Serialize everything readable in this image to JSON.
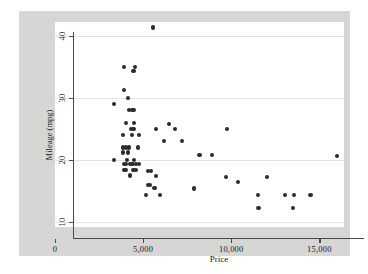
{
  "chart_data": {
    "type": "scatter",
    "title": "",
    "xlabel": "Price",
    "ylabel": "Mileage (mpg)",
    "xlim": [
      0,
      16400
    ],
    "ylim": [
      9.2,
      42.2
    ],
    "grid": true,
    "legend": null,
    "xticks": [
      0,
      5000,
      10000,
      15000
    ],
    "xticklabels": [
      "0",
      "5,000",
      "10,000",
      "15,000"
    ],
    "yticks": [
      10,
      20,
      30,
      40
    ],
    "yticklabels": [
      "10",
      "20",
      "30",
      "40"
    ],
    "marker_color": "#2b2b2b",
    "plot_bg": "#ffffff",
    "figure_bg": "#d6d6d4",
    "grid_color": "#e2e2e2",
    "n_points": 74,
    "points": [
      [
        5550,
        41.3
      ],
      [
        3900,
        35.0
      ],
      [
        4550,
        35.0
      ],
      [
        4450,
        34.3
      ],
      [
        3900,
        31.2
      ],
      [
        3350,
        29.0
      ],
      [
        4150,
        30.0
      ],
      [
        4200,
        28.0
      ],
      [
        4350,
        28.0
      ],
      [
        4450,
        28.0
      ],
      [
        4050,
        26.0
      ],
      [
        4500,
        26.0
      ],
      [
        6450,
        25.8
      ],
      [
        5750,
        25.0
      ],
      [
        4300,
        25.0
      ],
      [
        4450,
        25.0
      ],
      [
        6800,
        25.0
      ],
      [
        9750,
        25.0
      ],
      [
        3850,
        24.0
      ],
      [
        4350,
        24.0
      ],
      [
        4750,
        24.0
      ],
      [
        6200,
        23.0
      ],
      [
        7200,
        23.0
      ],
      [
        3850,
        22.0
      ],
      [
        4050,
        22.0
      ],
      [
        4200,
        22.0
      ],
      [
        4700,
        22.0
      ],
      [
        3850,
        21.2
      ],
      [
        4150,
        21.2
      ],
      [
        8200,
        20.8
      ],
      [
        8900,
        20.8
      ],
      [
        16000,
        20.6
      ],
      [
        3350,
        20.0
      ],
      [
        4100,
        20.0
      ],
      [
        4500,
        20.0
      ],
      [
        3900,
        19.3
      ],
      [
        4050,
        19.3
      ],
      [
        4250,
        19.3
      ],
      [
        4400,
        19.3
      ],
      [
        4600,
        19.3
      ],
      [
        4750,
        19.3
      ],
      [
        3900,
        18.4
      ],
      [
        4000,
        18.4
      ],
      [
        4450,
        18.4
      ],
      [
        4600,
        18.4
      ],
      [
        5300,
        18.2
      ],
      [
        5450,
        18.2
      ],
      [
        4250,
        17.5
      ],
      [
        5750,
        17.4
      ],
      [
        9700,
        17.3
      ],
      [
        12050,
        17.2
      ],
      [
        10400,
        16.5
      ],
      [
        5300,
        16.0
      ],
      [
        5400,
        16.0
      ],
      [
        5650,
        15.5
      ],
      [
        7900,
        15.4
      ],
      [
        5150,
        14.4
      ],
      [
        5950,
        14.4
      ],
      [
        11500,
        14.4
      ],
      [
        13050,
        14.4
      ],
      [
        13550,
        14.4
      ],
      [
        14500,
        14.4
      ],
      [
        11550,
        12.3
      ],
      [
        13500,
        12.3
      ]
    ]
  },
  "axes": {
    "x_title": "Price",
    "y_title": "Mileage (mpg)"
  }
}
